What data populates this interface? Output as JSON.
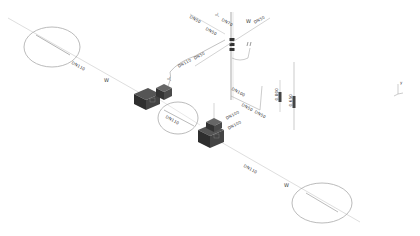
{
  "drawing": {
    "type": "isometric piping schematic",
    "line_color": "#bbbbbb",
    "pipe_color": "#999999",
    "equipment_color": "#3a3a3a",
    "background": "#ffffff"
  },
  "labels": {
    "dn_left_main": "DN110",
    "w_left": "W",
    "dn_center_circle": "DN110",
    "dn_lower_main": "DN110",
    "w_lower": "W",
    "dn_top_left_1": "DN50",
    "dn_top_left_2": "DN50",
    "dn_top_1": "DN50",
    "dn_top_center": "DN70",
    "dn_top_right": "DN50",
    "w_top_right": "W",
    "top_marker": "JL",
    "dn_mid_branch_1": "DN110",
    "dn_mid_branch_2": "DN50",
    "dn_riser_1": "DN100",
    "dn_riser_2": "DN50",
    "dn_riser_3": "DN50",
    "dn_box_1": "DN100",
    "dn_box_2": "DN100",
    "dim_1": "0.800",
    "dim_2": "0.650",
    "vert_tag": "JL",
    "axis_label": "y"
  },
  "circles": [
    {
      "name": "detail-circle-left",
      "cx": 52,
      "cy": 47,
      "rx": 28,
      "ry": 20
    },
    {
      "name": "detail-circle-center",
      "cx": 178,
      "cy": 118,
      "rx": 20,
      "ry": 16
    },
    {
      "name": "detail-circle-right",
      "cx": 322,
      "cy": 203,
      "rx": 30,
      "ry": 20
    }
  ]
}
